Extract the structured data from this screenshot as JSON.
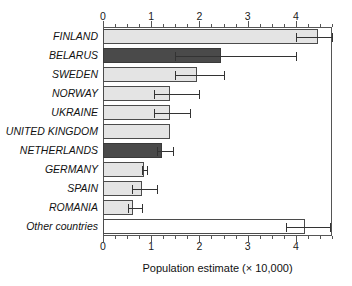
{
  "chart_data": {
    "type": "bar",
    "orientation": "horizontal",
    "title": "",
    "xlabel": "Population estimate (× 10,000)",
    "ylabel": "",
    "xlim": [
      0,
      4.75
    ],
    "xticks": [
      0,
      1,
      2,
      3,
      4
    ],
    "xtick_labels": [
      "0",
      "1",
      "2",
      "3",
      "4"
    ],
    "minor_tick_step": 0.25,
    "grid": false,
    "legend": "none",
    "axis_top": true,
    "axis_bottom": true,
    "categories": [
      "FINLAND",
      "BELARUS",
      "SWEDEN",
      "NORWAY",
      "UKRAINE",
      "UNITED KINGDOM",
      "NETHERLANDS",
      "GERMANY",
      "SPAIN",
      "ROMANIA",
      "Other countries"
    ],
    "values": [
      4.45,
      2.45,
      1.95,
      1.38,
      1.38,
      1.38,
      1.22,
      0.85,
      0.8,
      0.62,
      4.18
    ],
    "error_low": [
      4.0,
      1.5,
      1.5,
      1.05,
      1.05,
      null,
      1.12,
      0.8,
      0.6,
      0.52,
      3.8
    ],
    "error_high": [
      4.75,
      4.0,
      2.5,
      2.0,
      1.8,
      null,
      1.45,
      0.92,
      1.12,
      0.8,
      4.7
    ],
    "bar_styles": [
      "light",
      "dark",
      "light",
      "light",
      "light",
      "light",
      "dark",
      "light",
      "light",
      "light",
      "white"
    ],
    "colors": {
      "light_fill": "#e4e4e4",
      "dark_fill": "#4a4a4a",
      "white_fill": "#ffffff",
      "bar_edge": "#4b4b4b",
      "error_bar": "#333333",
      "axis": "#555555",
      "text": "#111111"
    }
  }
}
